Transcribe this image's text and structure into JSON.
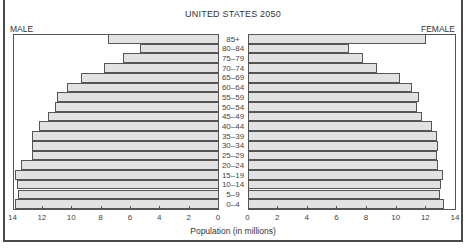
{
  "chart_data": {
    "type": "bar",
    "subtype": "population-pyramid",
    "title": "UNITED STATES 2050",
    "xlabel": "Population (in millions)",
    "ylabel": "",
    "left_label": "MALE",
    "right_label": "FEMALE",
    "categories": [
      "85+",
      "80–84",
      "75–79",
      "70–74",
      "65–69",
      "60–64",
      "55–59",
      "50–54",
      "45–49",
      "40–44",
      "35–39",
      "30–34",
      "25–29",
      "20–24",
      "15–19",
      "10–14",
      "5–9",
      "0–4"
    ],
    "series": [
      {
        "name": "MALE",
        "values": [
          7.5,
          5.3,
          6.5,
          7.8,
          9.3,
          10.3,
          11.0,
          11.1,
          11.6,
          12.2,
          12.7,
          12.7,
          12.7,
          13.4,
          13.8,
          13.7,
          13.6,
          13.8
        ]
      },
      {
        "name": "FEMALE",
        "values": [
          12.0,
          6.8,
          7.7,
          8.7,
          10.2,
          11.0,
          11.5,
          11.4,
          11.7,
          12.4,
          12.7,
          12.8,
          12.7,
          12.8,
          13.1,
          13.0,
          12.9,
          13.2
        ]
      }
    ],
    "xlim": [
      0,
      14
    ],
    "male_ticks": [
      "14",
      "12",
      "10",
      "8",
      "6",
      "4",
      "2",
      "0"
    ],
    "female_ticks": [
      "0",
      "2",
      "4",
      "6",
      "8",
      "10",
      "12",
      "14"
    ],
    "grid": false,
    "legend": "side labels (MALE left, FEMALE right)"
  },
  "colors": {
    "bar_fill": "#e2e2e2",
    "bar_border": "#555555",
    "frame": "#4a4a4a"
  }
}
